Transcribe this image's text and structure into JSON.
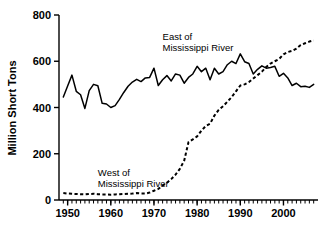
{
  "chart_data": {
    "type": "line",
    "title": "",
    "xlabel": "",
    "ylabel": "Million Short Tons",
    "xlim": [
      1948,
      2008
    ],
    "ylim": [
      0,
      800
    ],
    "yticks": [
      0,
      200,
      400,
      600,
      800
    ],
    "ytick_labels": [
      "0",
      "200",
      "400",
      "600",
      "800"
    ],
    "xticks": [
      1950,
      1960,
      1970,
      1980,
      1990,
      2000
    ],
    "xtick_labels": [
      "1950",
      "1960",
      "1970",
      "1980",
      "1990",
      "2000"
    ],
    "x_minor_tick_interval": 1,
    "grid": false,
    "legend_position": "inline-annotation",
    "annotations": [
      {
        "id": "east-annotation",
        "text_line1": "East of",
        "text_line2": "Mississippi River",
        "x": 1972,
        "y": 690
      },
      {
        "id": "west-annotation",
        "text_line1": "West of",
        "text_line2": "Mississippi River",
        "x": 1957,
        "y": 105
      }
    ],
    "x": [
      1949,
      1950,
      1951,
      1952,
      1953,
      1954,
      1955,
      1956,
      1957,
      1958,
      1959,
      1960,
      1961,
      1962,
      1963,
      1964,
      1965,
      1966,
      1967,
      1968,
      1969,
      1970,
      1971,
      1972,
      1973,
      1974,
      1975,
      1976,
      1977,
      1978,
      1979,
      1980,
      1981,
      1982,
      1983,
      1984,
      1985,
      1986,
      1987,
      1988,
      1989,
      1990,
      1991,
      1992,
      1993,
      1994,
      1995,
      1996,
      1997,
      1998,
      1999,
      2000,
      2001,
      2002,
      2003,
      2004,
      2005,
      2006,
      2007
    ],
    "series": [
      {
        "name": "East of Mississippi River",
        "style": "solid",
        "color": "#000000",
        "values": [
          445,
          493,
          540,
          470,
          455,
          396,
          473,
          500,
          494,
          418,
          415,
          400,
          408,
          435,
          465,
          492,
          510,
          522,
          512,
          528,
          530,
          570,
          495,
          520,
          538,
          515,
          545,
          540,
          505,
          530,
          545,
          578,
          555,
          570,
          520,
          570,
          545,
          555,
          585,
          600,
          590,
          632,
          598,
          590,
          545,
          565,
          580,
          570,
          573,
          578,
          535,
          548,
          528,
          495,
          505,
          490,
          492,
          487,
          500
        ]
      },
      {
        "name": "West of Mississippi River",
        "style": "dashed",
        "color": "#000000",
        "values": [
          30,
          28,
          27,
          26,
          25,
          24,
          26,
          27,
          25,
          24,
          24,
          23,
          24,
          25,
          26,
          27,
          28,
          30,
          28,
          28,
          32,
          40,
          48,
          62,
          75,
          90,
          110,
          135,
          170,
          250,
          262,
          275,
          300,
          320,
          330,
          365,
          390,
          405,
          425,
          445,
          470,
          495,
          500,
          510,
          525,
          540,
          555,
          575,
          590,
          600,
          610,
          630,
          640,
          645,
          655,
          670,
          678,
          685,
          690
        ]
      }
    ]
  }
}
